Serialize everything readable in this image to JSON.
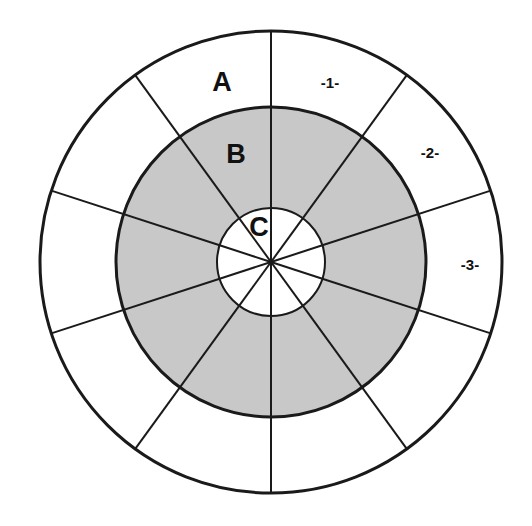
{
  "diagram": {
    "type": "concentric-zone-target",
    "title": "",
    "canvas": {
      "width": 532,
      "height": 526
    },
    "center": {
      "x": 271,
      "y": 262
    },
    "background_color": "#ffffff",
    "stroke_color": "#1a1a1a",
    "fill_white": "#ffffff",
    "fill_gray": "#c8c8c8",
    "rings": [
      {
        "id": "outer-ring",
        "zone_letter": "A",
        "radius": 231,
        "fill": "#ffffff",
        "stroke_width": 3
      },
      {
        "id": "middle-ring",
        "zone_letter": "B",
        "radius": 155,
        "fill": "#c8c8c8",
        "stroke_width": 3
      },
      {
        "id": "inner-circle",
        "zone_letter": "C",
        "radius": 54,
        "fill": "#ffffff",
        "stroke_width": 2
      }
    ],
    "spokes": {
      "count": 10,
      "spacing_degrees": 36,
      "angles_degrees": [
        18,
        54,
        90,
        126,
        162,
        198,
        234,
        270,
        306,
        342
      ],
      "stroke_width": 2
    },
    "zone_labels": [
      {
        "id": "zone-a",
        "text": "A",
        "x": 222,
        "y": 84,
        "ring": "outer-ring"
      },
      {
        "id": "zone-b",
        "text": "B",
        "x": 236,
        "y": 156,
        "ring": "middle-ring"
      },
      {
        "id": "zone-c",
        "text": "C",
        "x": 259,
        "y": 229,
        "ring": "inner-circle"
      }
    ],
    "sector_labels": [
      {
        "id": "sector-1",
        "text": "-1-",
        "x": 330,
        "y": 84
      },
      {
        "id": "sector-2",
        "text": "-2-",
        "x": 430,
        "y": 154
      },
      {
        "id": "sector-3",
        "text": "-3-",
        "x": 470,
        "y": 266
      }
    ]
  }
}
